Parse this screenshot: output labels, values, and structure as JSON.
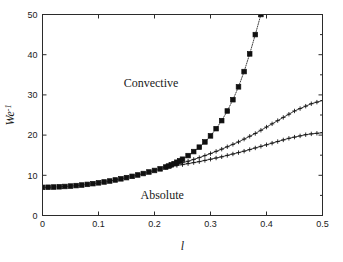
{
  "figure": {
    "width": 343,
    "height": 262,
    "background": "#ffffff",
    "axes_color": "#2b2b2b",
    "curve_color": "#101010"
  },
  "chart_data": {
    "type": "line",
    "title": "",
    "subtitle": "",
    "xlabel": "l",
    "ylabel": "We",
    "ylabel_superscript": "-1",
    "xlim": [
      0,
      0.5
    ],
    "ylim": [
      0,
      50
    ],
    "xticks": [
      0,
      0.1,
      0.2,
      0.3,
      0.4,
      0.5
    ],
    "xticklabels": [
      "0",
      "0.1",
      "0.2",
      "0.3",
      "0.4",
      "0.5"
    ],
    "yticks": [
      0,
      10,
      20,
      30,
      40,
      50
    ],
    "yticklabels": [
      "0",
      "10",
      "20",
      "30",
      "40",
      "50"
    ],
    "grid": false,
    "legend": false,
    "legend_position": "none",
    "annotations": [
      {
        "text": "Convective",
        "x": 0.145,
        "y": 32.0,
        "name": "convective-region-label"
      },
      {
        "text": "Absolute",
        "x": 0.175,
        "y": 4.2,
        "name": "absolute-region-label"
      }
    ],
    "series": [
      {
        "name": "branch-steep",
        "marker": "square",
        "marker_filled": true,
        "marker_size": 2.3,
        "linestyle": "dotted",
        "linewidth": 0.8,
        "color": "#101010",
        "x": [
          0.0,
          0.01,
          0.02,
          0.03,
          0.04,
          0.05,
          0.06,
          0.07,
          0.08,
          0.09,
          0.1,
          0.11,
          0.12,
          0.13,
          0.14,
          0.15,
          0.16,
          0.17,
          0.18,
          0.19,
          0.2,
          0.21,
          0.22,
          0.225,
          0.23,
          0.235,
          0.24,
          0.245,
          0.25,
          0.26,
          0.27,
          0.28,
          0.29,
          0.3,
          0.31,
          0.32,
          0.33,
          0.34,
          0.35,
          0.36,
          0.37,
          0.38,
          0.39
        ],
        "y": [
          7.0,
          7.03,
          7.08,
          7.14,
          7.22,
          7.32,
          7.44,
          7.58,
          7.74,
          7.92,
          8.12,
          8.34,
          8.58,
          8.84,
          9.12,
          9.42,
          9.74,
          10.08,
          10.44,
          10.82,
          11.2,
          11.6,
          12.05,
          12.3,
          12.6,
          12.9,
          13.25,
          13.6,
          14.0,
          14.9,
          15.9,
          17.0,
          18.3,
          19.8,
          21.6,
          23.6,
          26.0,
          28.8,
          32.0,
          35.8,
          40.2,
          45.0,
          50.0
        ]
      },
      {
        "name": "branch-middle",
        "marker": "plus",
        "marker_filled": false,
        "marker_size": 2.2,
        "linestyle": "solid",
        "linewidth": 0.8,
        "color": "#101010",
        "x": [
          0.22,
          0.23,
          0.24,
          0.25,
          0.26,
          0.27,
          0.28,
          0.29,
          0.3,
          0.31,
          0.32,
          0.33,
          0.34,
          0.35,
          0.36,
          0.37,
          0.38,
          0.39,
          0.4,
          0.41,
          0.42,
          0.43,
          0.44,
          0.45,
          0.46,
          0.47,
          0.48,
          0.49,
          0.5
        ],
        "y": [
          12.05,
          12.4,
          12.75,
          13.1,
          13.5,
          13.95,
          14.4,
          14.9,
          15.4,
          15.95,
          16.5,
          17.1,
          17.7,
          18.3,
          19.0,
          19.7,
          20.4,
          21.2,
          22.0,
          22.8,
          23.6,
          24.4,
          25.2,
          26.0,
          26.6,
          27.2,
          27.8,
          28.2,
          28.6
        ]
      },
      {
        "name": "branch-lower",
        "marker": "plus",
        "marker_filled": false,
        "marker_size": 2.2,
        "linestyle": "solid",
        "linewidth": 0.8,
        "color": "#101010",
        "x": [
          0.22,
          0.23,
          0.24,
          0.25,
          0.26,
          0.27,
          0.28,
          0.29,
          0.3,
          0.31,
          0.32,
          0.33,
          0.34,
          0.35,
          0.36,
          0.37,
          0.38,
          0.39,
          0.4,
          0.41,
          0.42,
          0.43,
          0.44,
          0.45,
          0.46,
          0.47,
          0.48,
          0.49,
          0.5
        ],
        "y": [
          12.05,
          12.25,
          12.45,
          12.65,
          12.9,
          13.15,
          13.4,
          13.7,
          14.0,
          14.3,
          14.6,
          14.95,
          15.3,
          15.65,
          16.0,
          16.4,
          16.8,
          17.2,
          17.6,
          18.0,
          18.4,
          18.8,
          19.2,
          19.5,
          19.8,
          20.1,
          20.3,
          20.45,
          20.6
        ]
      }
    ]
  }
}
